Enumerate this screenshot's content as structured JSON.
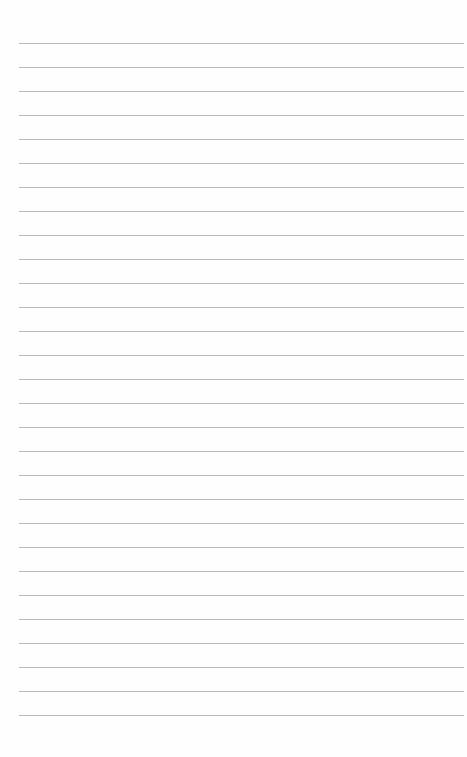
{
  "page": {
    "type": "lined-paper",
    "background": "#fefefe",
    "rule_color": "#b9b9b9",
    "rule_count": 29,
    "first_rule_y": 43,
    "rule_spacing": 24,
    "rule_left": 19,
    "rule_width": 445
  }
}
